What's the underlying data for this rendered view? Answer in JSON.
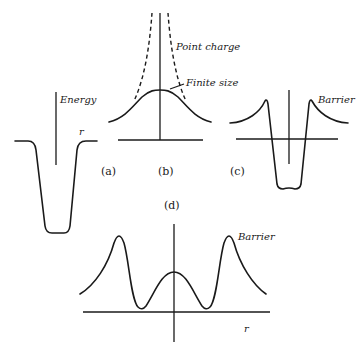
{
  "figure": {
    "panels": [
      {
        "id": "a",
        "label": "(a)",
        "axis_label_y": "Energy",
        "axis_label_x": "r",
        "description": "square-like potential well"
      },
      {
        "id": "b",
        "label": "(b)",
        "annotations": [
          "Point charge",
          "Finite size"
        ],
        "description": "Coulomb potential: point charge (dashed) vs finite size (solid)"
      },
      {
        "id": "c",
        "label": "(c)",
        "annotations": [
          "Barrier"
        ],
        "description": "nuclear well with Coulomb barrier"
      },
      {
        "id": "d",
        "label": "(d)",
        "annotations": [
          "Barrier"
        ],
        "axis_label_x": "r",
        "description": "double barrier potential"
      }
    ]
  }
}
